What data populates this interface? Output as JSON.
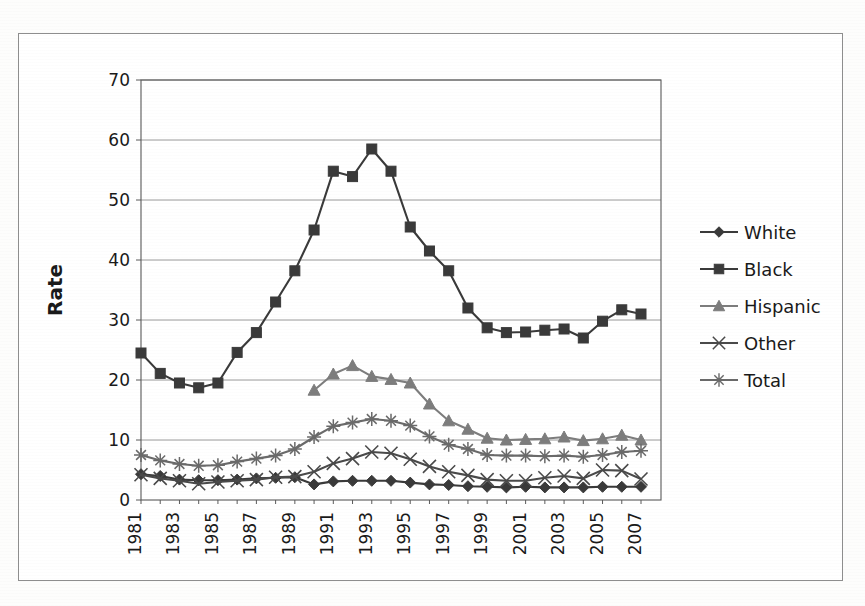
{
  "chart_data": {
    "type": "line",
    "title": "",
    "xlabel": "",
    "ylabel": "Rate",
    "ylim": [
      0,
      70
    ],
    "ytick_step": 10,
    "yticks": [
      "0",
      "10",
      "20",
      "30",
      "40",
      "50",
      "60",
      "70"
    ],
    "grid": true,
    "grid_axis": "y",
    "legend_position": "right",
    "x": [
      1981,
      1982,
      1983,
      1984,
      1985,
      1986,
      1987,
      1988,
      1989,
      1990,
      1991,
      1992,
      1993,
      1994,
      1995,
      1996,
      1997,
      1998,
      1999,
      2000,
      2001,
      2002,
      2003,
      2004,
      2005,
      2006,
      2007
    ],
    "xtick_labels": [
      "1981",
      "1983",
      "1985",
      "1987",
      "1989",
      "1991",
      "1993",
      "1995",
      "1997",
      "1999",
      "2001",
      "2003",
      "2005",
      "2007"
    ],
    "xtick_rotation": 90,
    "series": [
      {
        "name": "White",
        "marker": "diamond",
        "color": "#3a3a3a",
        "values": [
          4.3,
          4.0,
          3.4,
          3.3,
          3.3,
          3.4,
          3.6,
          3.7,
          3.8,
          2.6,
          3.1,
          3.2,
          3.2,
          3.2,
          2.9,
          2.6,
          2.5,
          2.3,
          2.2,
          2.1,
          2.2,
          2.1,
          2.1,
          2.1,
          2.2,
          2.2,
          2.2
        ]
      },
      {
        "name": "Black",
        "marker": "square",
        "color": "#3a3a3a",
        "values": [
          24.5,
          21.1,
          19.5,
          18.7,
          19.5,
          24.6,
          27.9,
          33.0,
          38.2,
          45.0,
          54.8,
          53.9,
          58.5,
          54.8,
          45.5,
          41.5,
          38.2,
          32.0,
          28.7,
          27.9,
          28.0,
          28.3,
          28.5,
          27.0,
          29.8,
          31.7,
          31.0
        ]
      },
      {
        "name": "Hispanic",
        "marker": "triangle",
        "color": "#7d7d7d",
        "values": [
          null,
          null,
          null,
          null,
          null,
          null,
          null,
          null,
          null,
          18.3,
          21.0,
          22.4,
          20.6,
          20.1,
          19.5,
          16.0,
          13.2,
          11.8,
          10.3,
          10.0,
          10.1,
          10.2,
          10.5,
          9.9,
          10.2,
          10.8,
          10.0
        ]
      },
      {
        "name": "Other",
        "marker": "cross",
        "color": "#4a4a4a",
        "values": [
          4.2,
          3.6,
          3.2,
          2.7,
          3.0,
          3.2,
          3.4,
          3.8,
          3.9,
          4.7,
          6.1,
          6.9,
          8.0,
          7.8,
          6.8,
          5.6,
          4.7,
          4.1,
          3.4,
          3.2,
          3.2,
          3.7,
          4.0,
          3.6,
          5.0,
          4.9,
          3.5
        ]
      },
      {
        "name": "Total",
        "marker": "asterisk",
        "color": "#6a6a6a",
        "values": [
          7.5,
          6.6,
          6.0,
          5.7,
          5.8,
          6.4,
          6.9,
          7.4,
          8.5,
          10.5,
          12.3,
          12.9,
          13.5,
          13.2,
          12.4,
          10.6,
          9.2,
          8.5,
          7.5,
          7.4,
          7.4,
          7.3,
          7.4,
          7.2,
          7.5,
          8.0,
          8.2
        ]
      }
    ],
    "legend": [
      {
        "label": "White",
        "marker": "diamond",
        "color": "#3a3a3a"
      },
      {
        "label": "Black",
        "marker": "square",
        "color": "#3a3a3a"
      },
      {
        "label": "Hispanic",
        "marker": "triangle",
        "color": "#7d7d7d"
      },
      {
        "label": "Other",
        "marker": "cross",
        "color": "#4a4a4a"
      },
      {
        "label": "Total",
        "marker": "asterisk",
        "color": "#6a6a6a"
      }
    ],
    "colors": {
      "axis": "#5a5a5a",
      "grid": "#9a9a9a",
      "frame": "#8e8e8e",
      "text": "#1a1a1a",
      "background": "#ffffff"
    }
  }
}
